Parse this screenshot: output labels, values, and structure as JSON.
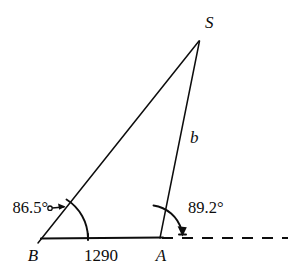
{
  "figure": {
    "type": "geometry-triangle-diagram",
    "background_color": "#ffffff",
    "ink_color": "#0d0d0d",
    "vertices": {
      "B": {
        "label": "B",
        "x": 42,
        "y": 238
      },
      "A": {
        "label": "A",
        "x": 160,
        "y": 238
      },
      "S": {
        "label": "S",
        "x": 199,
        "y": 41
      }
    },
    "labels": {
      "apex": "S",
      "left_vertex": "B",
      "right_vertex": "A",
      "side_b": "b",
      "baseline_length": "1290",
      "angle_at_b": "86.5°",
      "angle_at_a": "89.2°"
    },
    "segments": [
      {
        "name": "base-BA",
        "from": "B",
        "to": "A",
        "style": "solid",
        "measure": "1290"
      },
      {
        "name": "side-BS",
        "from": "B",
        "to": "S",
        "style": "solid",
        "measure": ""
      },
      {
        "name": "side-AS",
        "from": "A",
        "to": "S",
        "style": "solid",
        "measure": "b"
      },
      {
        "name": "ray-A-east",
        "from": "A",
        "to": "east-edge",
        "style": "dashed",
        "measure": ""
      }
    ],
    "angles": [
      {
        "name": "angle-b",
        "at": "B",
        "value": "86.5°",
        "between": [
          "base-BA",
          "side-BS"
        ]
      },
      {
        "name": "angle-a",
        "at": "A",
        "value": "89.2°",
        "between": [
          "side-AS",
          "ray-A-east"
        ]
      }
    ]
  }
}
